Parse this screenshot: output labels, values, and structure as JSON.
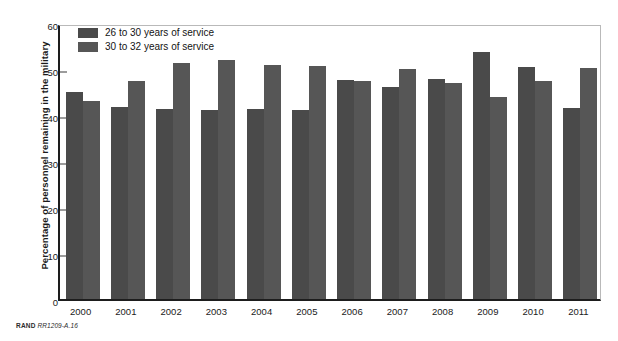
{
  "chart_data": {
    "type": "bar",
    "title": "",
    "xlabel": "",
    "ylabel": "Percentage of personnel remaining in the military",
    "ylim": [
      0,
      60
    ],
    "yticks": [
      0,
      10,
      20,
      30,
      40,
      50,
      60
    ],
    "grid": false,
    "legend_position": "top-left",
    "categories": [
      "2000",
      "2001",
      "2002",
      "2003",
      "2004",
      "2005",
      "2006",
      "2007",
      "2008",
      "2009",
      "2010",
      "2011"
    ],
    "series": [
      {
        "name": "26 to 30 years of service",
        "color": "#4a4a4a",
        "values": [
          45.0,
          41.7,
          41.3,
          41.0,
          41.2,
          41.0,
          47.7,
          46.0,
          47.8,
          53.7,
          50.5,
          41.5
        ]
      },
      {
        "name": "30 to 32 years of service",
        "color": "#565656",
        "values": [
          43.0,
          47.3,
          51.3,
          52.0,
          50.8,
          50.7,
          47.5,
          50.0,
          47.0,
          44.0,
          47.5,
          50.3
        ]
      }
    ]
  },
  "source_note": {
    "organization": "RAND",
    "code": "RR1209-A.16"
  }
}
